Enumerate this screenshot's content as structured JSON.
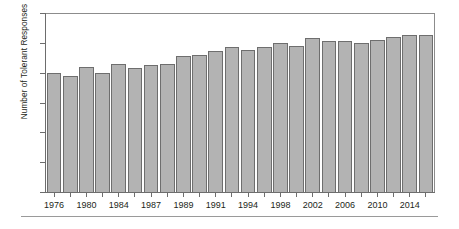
{
  "chart_data": {
    "type": "bar",
    "title": "",
    "xlabel": "",
    "ylabel": "Number of Tolerant Responses",
    "ylim": [
      0,
      12
    ],
    "y_ticks": [
      0,
      2,
      4,
      6,
      8,
      10,
      12
    ],
    "grid": false,
    "legend": null,
    "x_tick_labels": [
      "1976",
      "1980",
      "1984",
      "1987",
      "1989",
      "1991",
      "1994",
      "1998",
      "2002",
      "2006",
      "2010",
      "2014"
    ],
    "categories": [
      "1976",
      "1977",
      "1980",
      "1982",
      "1984",
      "1985",
      "1987",
      "1988",
      "1989",
      "1990",
      "1991",
      "1993",
      "1994",
      "1996",
      "1998",
      "2000",
      "2002",
      "2004",
      "2006",
      "2008",
      "2010",
      "2012",
      "2014",
      "2016"
    ],
    "values": [
      8.0,
      7.8,
      8.4,
      8.0,
      8.55,
      8.3,
      8.5,
      8.6,
      9.1,
      9.2,
      9.45,
      9.7,
      9.55,
      9.7,
      10.0,
      9.8,
      10.3,
      10.15,
      10.1,
      10.0,
      10.2,
      10.4,
      10.5,
      10.5
    ],
    "bar_color": "#b3b3b3",
    "bar_edge_color": "#6e6e6e",
    "axis_color": "#6d6d6d"
  },
  "figure": {
    "rule_visible": true
  }
}
